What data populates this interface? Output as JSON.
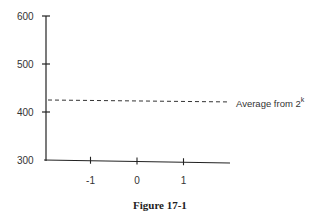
{
  "chart_data": {
    "type": "line",
    "title": "",
    "caption": "Figure 17-1",
    "xlabel": "",
    "ylabel": "",
    "x_ticks": [
      "-1",
      "0",
      "1"
    ],
    "x_tick_values": [
      -1,
      0,
      1
    ],
    "xlim": [
      -2,
      2
    ],
    "y_ticks": [
      "300",
      "400",
      "500",
      "600"
    ],
    "y_tick_values": [
      300,
      400,
      500,
      600
    ],
    "ylim": [
      300,
      600
    ],
    "grid": false,
    "series": [
      {
        "name": "Average from 2^k",
        "style": "dashed",
        "x": [
          -2,
          2
        ],
        "y": [
          425,
          421
        ]
      }
    ],
    "annotations": [
      {
        "text": "Average from 2",
        "superscript": "k",
        "attached_to": "Average from 2^k"
      }
    ]
  }
}
